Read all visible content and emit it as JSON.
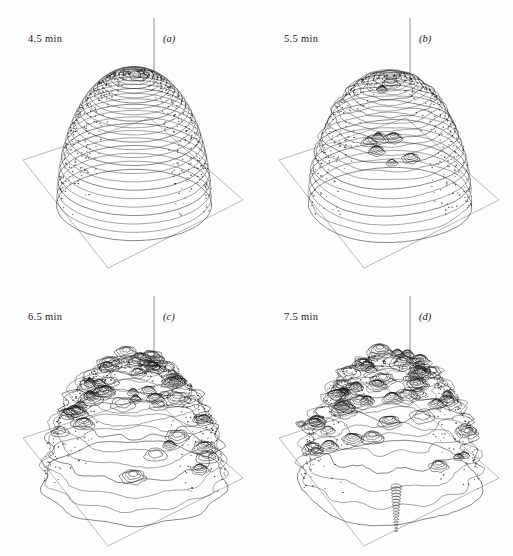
{
  "figure": {
    "kind": "scientific-figure",
    "background_color": "#fefefe",
    "ink_color": "#1a1a1a",
    "plane_color": "#9a9a9a",
    "axis_color": "#6e6e6e",
    "columns": 2,
    "rows": 2
  },
  "panels": [
    {
      "id": "panel-a",
      "letter": "(a)",
      "time_label": "4.5 min",
      "stage": "smooth-dome",
      "contour_rings": 26,
      "apex_cells": 1,
      "roughness": 0.06,
      "dome_width": 150,
      "dome_height": 132,
      "axis_top": 18,
      "axis_bottom": 86,
      "seed": 11
    },
    {
      "id": "panel-b",
      "letter": "(b)",
      "time_label": "5.5 min",
      "stage": "wrinkled-dome",
      "contour_rings": 24,
      "apex_cells": 9,
      "roughness": 0.16,
      "dome_width": 158,
      "dome_height": 128,
      "axis_top": 18,
      "axis_bottom": 86,
      "seed": 23
    },
    {
      "id": "panel-c",
      "letter": "(c)",
      "time_label": "6.5 min",
      "stage": "cellular",
      "contour_rings": 14,
      "apex_cells": 46,
      "roughness": 0.42,
      "dome_width": 178,
      "dome_height": 118,
      "axis_top": 18,
      "axis_bottom": 86,
      "seed": 37
    },
    {
      "id": "panel-d",
      "letter": "(d)",
      "time_label": "7.5 min",
      "stage": "fragmented",
      "contour_rings": 12,
      "apex_cells": 54,
      "roughness": 0.55,
      "dome_width": 176,
      "dome_height": 122,
      "axis_top": 18,
      "axis_bottom": 86,
      "seed": 53,
      "has_satellite_blob": true,
      "has_downward_spike": true
    }
  ],
  "ground_plane": {
    "left_corner": [
      23,
      160
    ],
    "bottom_corner": [
      108,
      268
    ],
    "right_corner": [
      243,
      200
    ],
    "top_corner": [
      150,
      118
    ]
  },
  "chart_data": {
    "type": "surface-contour",
    "title": "",
    "series": [
      {
        "name": "4.5 min",
        "panel": "(a)",
        "mean_radius": 1.0,
        "perturbation_amplitude": 0.03,
        "dominant_mode": 0
      },
      {
        "name": "5.5 min",
        "panel": "(b)",
        "mean_radius": 1.05,
        "perturbation_amplitude": 0.09,
        "dominant_mode": 6
      },
      {
        "name": "6.5 min",
        "panel": "(c)",
        "mean_radius": 1.18,
        "perturbation_amplitude": 0.26,
        "dominant_mode": 14
      },
      {
        "name": "7.5 min",
        "panel": "(d)",
        "mean_radius": 1.17,
        "perturbation_amplitude": 0.34,
        "dominant_mode": 18
      }
    ],
    "xlabel": "",
    "ylabel": "",
    "zlabel": "",
    "grid": false,
    "legend": "none"
  }
}
